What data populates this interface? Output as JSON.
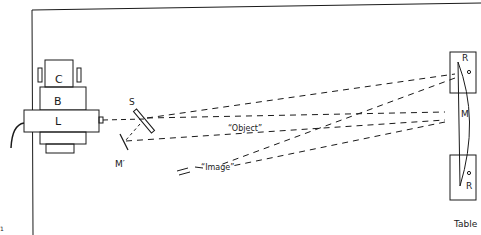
{
  "diagram": {
    "type": "optical-setup",
    "ink_color": "#1a1a1a",
    "background": "#ffffff"
  },
  "labels": {
    "camera": "C",
    "base": "B",
    "laser": "L",
    "splitter": "S",
    "small_mirror": "M′",
    "object": "“Object”",
    "image": "“Image”",
    "main_mirror": "M",
    "support_top": "R",
    "support_bottom": "R",
    "table": "Table",
    "corner_mark": "1"
  }
}
